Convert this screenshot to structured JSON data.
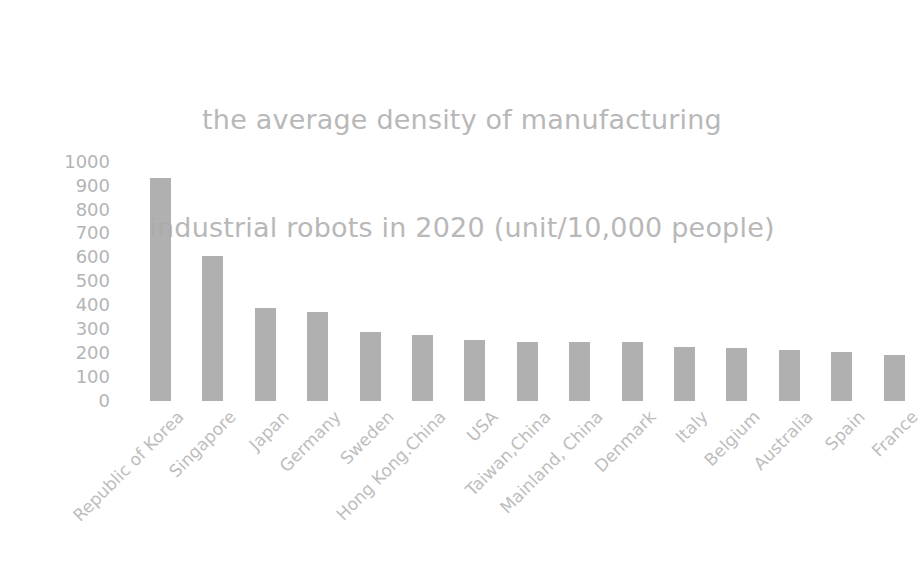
{
  "chart_data": {
    "type": "bar",
    "title": "the average density of manufacturing industrial robots in 2020 (unit/10,000 people)",
    "title_lines": [
      "the average density of manufacturing",
      "industrial robots in 2020 (unit/10,000 people)"
    ],
    "xlabel": "",
    "ylabel": "",
    "ylim": [
      0,
      1000
    ],
    "yticks": [
      1000,
      900,
      800,
      700,
      600,
      500,
      400,
      300,
      200,
      100,
      0
    ],
    "ytick_labels": [
      "1000",
      "900",
      "800",
      "700",
      "600",
      "500",
      "400",
      "300",
      "200",
      "100",
      "0"
    ],
    "grid": false,
    "legend": null,
    "bar_color": "#a9a9a9",
    "text_color": "#b8b8b8",
    "categories": [
      "Republic of Korea",
      "Singapore",
      "Japan",
      "Germany",
      "Sweden",
      "Hong Kong.China",
      "USA",
      "Taiwan,China",
      "Mainland, China",
      "Denmark",
      "Italy",
      "Belgium",
      "Australia",
      "Spain",
      "France"
    ],
    "values": [
      932,
      605,
      390,
      371,
      289,
      275,
      255,
      248,
      246,
      246,
      224,
      221,
      212,
      203,
      194
    ]
  },
  "figure": {
    "background": "#ffffff",
    "width": 924,
    "height": 579
  }
}
